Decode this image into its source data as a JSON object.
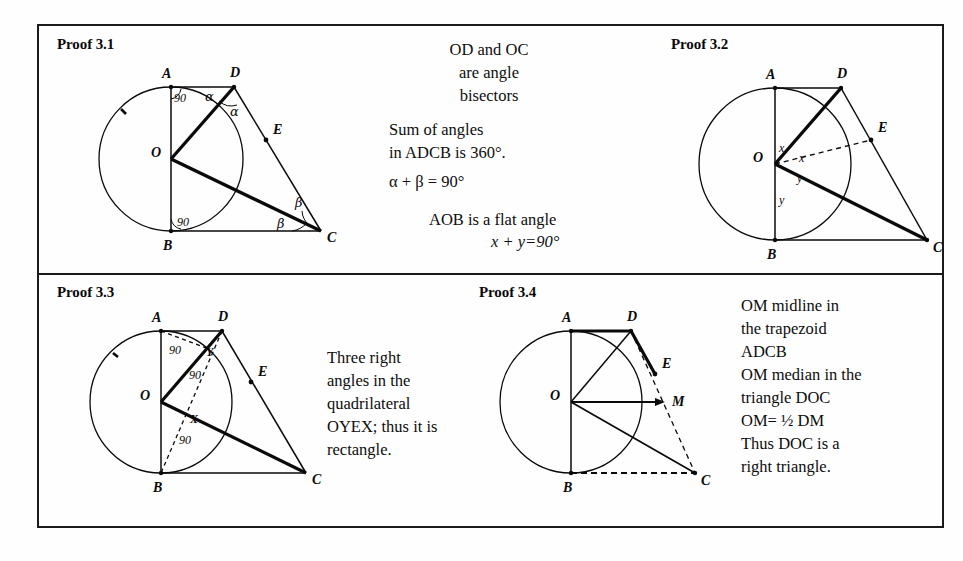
{
  "figure": {
    "panels": [
      {
        "id": "proof-3-1",
        "title": "Proof 3.1",
        "point_labels": [
          "A",
          "D",
          "E",
          "O",
          "B",
          "C"
        ],
        "angle_labels": [
          "90",
          "90",
          "α",
          "α",
          "β",
          "β"
        ]
      },
      {
        "id": "proof-3-2",
        "title": "Proof 3.2",
        "point_labels": [
          "A",
          "D",
          "E",
          "O",
          "B",
          "C"
        ],
        "angle_labels": [
          "x",
          "x",
          "y",
          "y"
        ]
      },
      {
        "id": "proof-3-3",
        "title": "Proof 3.3",
        "point_labels": [
          "A",
          "D",
          "E",
          "O",
          "B",
          "C",
          "Y",
          "X"
        ],
        "angle_labels": [
          "90",
          "90",
          "90"
        ]
      },
      {
        "id": "proof-3-4",
        "title": "Proof 3.4",
        "point_labels": [
          "A",
          "D",
          "E",
          "O",
          "B",
          "C",
          "M"
        ],
        "angle_labels": []
      }
    ],
    "notes": {
      "bisectors": "OD and OC\nare angle\nbisectors",
      "sum_of_angles": "Sum of angles\nin ADCB is 360°.",
      "alpha_beta": "α + β = 90°",
      "flat_angle": "AOB is a flat angle",
      "x_plus_y": "x + y=90°",
      "rectangle": "Three right\nangles in the\nquadrilateral\nOYEX; thus it is\nrectangle.",
      "midline": "OM midline in\nthe trapezoid\nADCB\nOM median in the\ntriangle DOC\nOM= ½ DM\nThus DOC is a\nright triangle."
    },
    "colors": {
      "ink": "#0a0a0a",
      "paper": "#fefefe",
      "frame": "#1a1a1a"
    }
  }
}
